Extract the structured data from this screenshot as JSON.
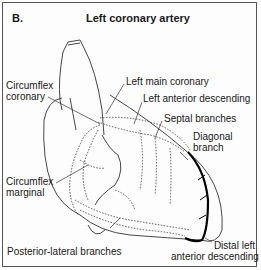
{
  "figure": {
    "panel_label": "B.",
    "title": "Left coronary artery"
  },
  "labels": {
    "circumflex_coronary": [
      "Circumflex",
      "coronary"
    ],
    "left_main_coronary": "Left main coronary",
    "left_anterior_descending": "Left anterior descending",
    "septal_branches": "Septal branches",
    "diagonal_branch": [
      "Diagonal",
      "branch"
    ],
    "circumflex_marginal": [
      "Circumflex",
      "marginal"
    ],
    "posterior_lateral_branches": "Posterior-lateral branches",
    "distal_lad": [
      "Distal left",
      "anterior descending"
    ]
  }
}
